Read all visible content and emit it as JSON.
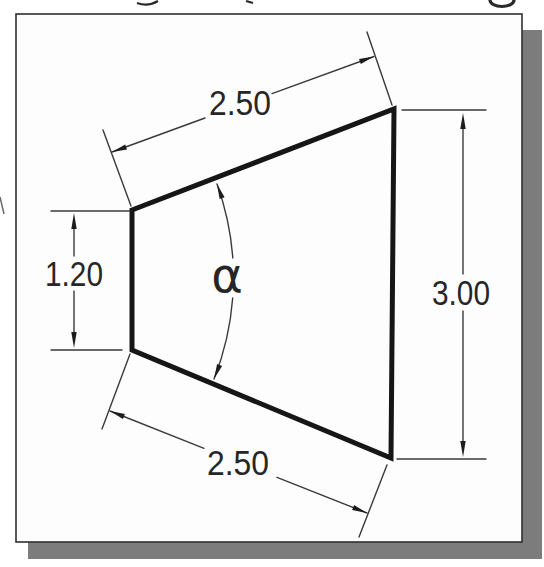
{
  "figure": {
    "type": "dimensioned-trapezoid-drawing",
    "labels": {
      "top_width": "2.50",
      "bottom_width": "2.50",
      "left_height": "1.20",
      "right_height": "3.00",
      "angle": "α"
    },
    "colors": {
      "paper": "#fdfdfd",
      "ink": "#1c1c1c",
      "thin_line": "#3a3a3a",
      "shadow": "#7c7c7c",
      "frame": "#2f2f2f"
    }
  }
}
